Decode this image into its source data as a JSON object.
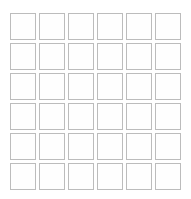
{
  "canvas": {
    "width": 191,
    "height": 199,
    "background_color": "#ffffff"
  },
  "grid": {
    "name": "empty-square-grid",
    "rows": 6,
    "columns": 6,
    "cell_count": 36,
    "cell_width": 26,
    "cell_height": 27,
    "gap": 3,
    "cell_fill_color": "#fefefe",
    "cell_border_color": "#bcbcbc",
    "cell_border_width": 1,
    "origin_x": 10,
    "origin_y": 13,
    "cells": [
      {
        "row": 1,
        "column": 1,
        "label": ""
      },
      {
        "row": 1,
        "column": 2,
        "label": ""
      },
      {
        "row": 1,
        "column": 3,
        "label": ""
      },
      {
        "row": 1,
        "column": 4,
        "label": ""
      },
      {
        "row": 1,
        "column": 5,
        "label": ""
      },
      {
        "row": 1,
        "column": 6,
        "label": ""
      },
      {
        "row": 2,
        "column": 1,
        "label": ""
      },
      {
        "row": 2,
        "column": 2,
        "label": ""
      },
      {
        "row": 2,
        "column": 3,
        "label": ""
      },
      {
        "row": 2,
        "column": 4,
        "label": ""
      },
      {
        "row": 2,
        "column": 5,
        "label": ""
      },
      {
        "row": 2,
        "column": 6,
        "label": ""
      },
      {
        "row": 3,
        "column": 1,
        "label": ""
      },
      {
        "row": 3,
        "column": 2,
        "label": ""
      },
      {
        "row": 3,
        "column": 3,
        "label": ""
      },
      {
        "row": 3,
        "column": 4,
        "label": ""
      },
      {
        "row": 3,
        "column": 5,
        "label": ""
      },
      {
        "row": 3,
        "column": 6,
        "label": ""
      },
      {
        "row": 4,
        "column": 1,
        "label": ""
      },
      {
        "row": 4,
        "column": 2,
        "label": ""
      },
      {
        "row": 4,
        "column": 3,
        "label": ""
      },
      {
        "row": 4,
        "column": 4,
        "label": ""
      },
      {
        "row": 4,
        "column": 5,
        "label": ""
      },
      {
        "row": 4,
        "column": 6,
        "label": ""
      },
      {
        "row": 5,
        "column": 1,
        "label": ""
      },
      {
        "row": 5,
        "column": 2,
        "label": ""
      },
      {
        "row": 5,
        "column": 3,
        "label": ""
      },
      {
        "row": 5,
        "column": 4,
        "label": ""
      },
      {
        "row": 5,
        "column": 5,
        "label": ""
      },
      {
        "row": 5,
        "column": 6,
        "label": ""
      },
      {
        "row": 6,
        "column": 1,
        "label": ""
      },
      {
        "row": 6,
        "column": 2,
        "label": ""
      },
      {
        "row": 6,
        "column": 3,
        "label": ""
      },
      {
        "row": 6,
        "column": 4,
        "label": ""
      },
      {
        "row": 6,
        "column": 5,
        "label": ""
      },
      {
        "row": 6,
        "column": 6,
        "label": ""
      }
    ]
  }
}
